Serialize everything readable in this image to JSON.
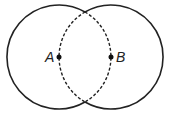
{
  "diagram": {
    "type": "intersecting-circles",
    "points": [
      {
        "label": "A",
        "x": 59,
        "y": 57
      },
      {
        "label": "B",
        "x": 111,
        "y": 57
      }
    ],
    "circles": [
      {
        "center": "A",
        "radius": 52,
        "arc_inside_other": "dashed"
      },
      {
        "center": "B",
        "radius": 52,
        "arc_inside_other": "dashed"
      }
    ],
    "colors": {
      "stroke": "#222222",
      "background": "#ffffff"
    }
  }
}
